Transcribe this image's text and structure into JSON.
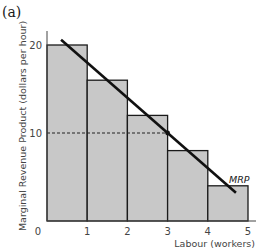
{
  "panel_label": "(a)",
  "chart_data": {
    "type": "bar",
    "title": "",
    "xlabel": "Labour (workers)",
    "ylabel": "Marginal Revenue Product (dollars per hour)",
    "x_ticks": [
      "0",
      "1",
      "2",
      "3",
      "4",
      "5"
    ],
    "y_ticks": [
      "10",
      "20"
    ],
    "xlim": [
      0,
      5
    ],
    "ylim": [
      0,
      22
    ],
    "grid": false,
    "bars": [
      {
        "x_start": 0,
        "x_end": 1,
        "value": 20
      },
      {
        "x_start": 1,
        "x_end": 2,
        "value": 16
      },
      {
        "x_start": 2,
        "x_end": 3,
        "value": 12
      },
      {
        "x_start": 3,
        "x_end": 4,
        "value": 8
      },
      {
        "x_start": 4,
        "x_end": 5,
        "value": 4
      }
    ],
    "series": [
      {
        "name": "MRP",
        "type": "line",
        "points": [
          [
            0.35,
            20.6
          ],
          [
            4.7,
            3.2
          ]
        ]
      }
    ],
    "annotations": [
      {
        "type": "dashed-hline",
        "y": 10,
        "x_from": 0,
        "x_to": 3
      },
      {
        "type": "point",
        "x": 3,
        "y": 10
      }
    ],
    "colors": {
      "bar_fill": "#c8c8c8",
      "bar_stroke": "#1a1a1a",
      "line": "#111111"
    }
  }
}
